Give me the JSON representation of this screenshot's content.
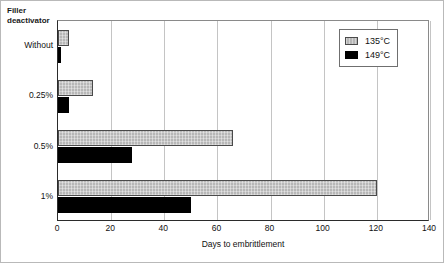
{
  "chart_data": {
    "type": "bar",
    "orientation": "horizontal",
    "title": "",
    "xlabel": "Days to embrittlement",
    "ylabel": "Filler deactivator",
    "ylabel_lines": [
      "Filler",
      "deactivator"
    ],
    "categories": [
      "Without",
      "0.25%",
      "0.5%",
      "1%"
    ],
    "series": [
      {
        "name": "135°C",
        "color": "#b7b7b7",
        "values": [
          4,
          13,
          66,
          120
        ]
      },
      {
        "name": "149°C",
        "color": "#000000",
        "values": [
          1,
          4,
          28,
          50
        ]
      }
    ],
    "xlim": [
      0,
      140
    ],
    "xticks": [
      0,
      20,
      40,
      60,
      80,
      100,
      120,
      140
    ],
    "xtick_labels": [
      "0",
      "20",
      "40",
      "60",
      "80",
      "100",
      "120",
      "140"
    ],
    "grid": "vertical",
    "legend_position": "top-right-inside"
  },
  "legend": {
    "entries": [
      {
        "label": "135°C"
      },
      {
        "label": "149°C"
      }
    ]
  }
}
